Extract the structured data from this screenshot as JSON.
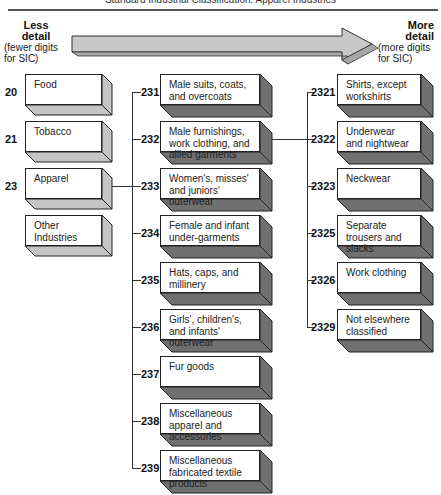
{
  "header": {
    "title": "Standard Industrial Classification: Apparel Industries"
  },
  "arrow": {
    "left_label": {
      "bold": [
        "Less",
        "detail"
      ],
      "sub": [
        "(fewer digits",
        "for SIC)"
      ]
    },
    "right_label": {
      "bold": [
        "More",
        "detail"
      ],
      "sub": [
        "(more digits",
        "for SIC)"
      ]
    }
  },
  "colors": {
    "arrow_fill": "#c8c8c8",
    "light_side": "#c4c4c4",
    "dark_side": "#707070",
    "face": "#ffffff",
    "line": "#333333"
  },
  "two_digit": [
    {
      "code": "20",
      "label": "Food"
    },
    {
      "code": "21",
      "label": "Tobacco"
    },
    {
      "code": "23",
      "label": "Apparel"
    },
    {
      "code": "",
      "label": "Other Industries"
    }
  ],
  "three_digit": [
    {
      "code": "231",
      "label": "Male suits, coats, and overcoats"
    },
    {
      "code": "232",
      "label": "Male furnishings, work clothing, and allied garments"
    },
    {
      "code": "233",
      "label": "Women's, misses' and juniors' outerwear"
    },
    {
      "code": "234",
      "label": "Female and infant under-garments"
    },
    {
      "code": "235",
      "label": "Hats, caps, and millinery"
    },
    {
      "code": "236",
      "label": "Girls', children's, and infants' outerwear"
    },
    {
      "code": "237",
      "label": "Fur goods"
    },
    {
      "code": "238",
      "label": "Miscellaneous apparel and accessories"
    },
    {
      "code": "239",
      "label": "Miscellaneous fabricated textile products"
    }
  ],
  "four_digit": [
    {
      "code": "2321",
      "label": "Shirts, except workshirts"
    },
    {
      "code": "2322",
      "label": "Underwear and nightwear"
    },
    {
      "code": "2323",
      "label": "Neckwear"
    },
    {
      "code": "2325",
      "label": "Separate trousers and slacks"
    },
    {
      "code": "2326",
      "label": "Work clothing"
    },
    {
      "code": "2329",
      "label": "Not elsewhere classified"
    }
  ]
}
